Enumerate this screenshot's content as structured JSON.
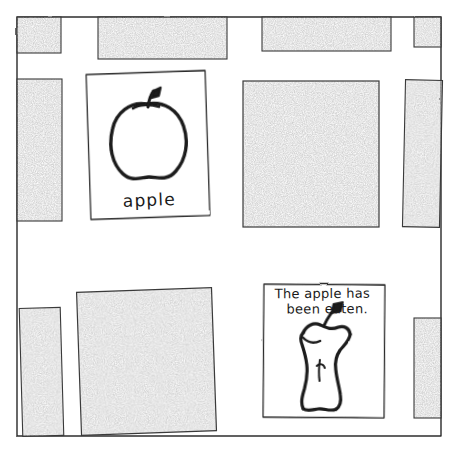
{
  "scene": {
    "title": "apple-and-eaten-apple-sketch",
    "background_color": "#ffffff",
    "ink_color": "#1a1a1a",
    "fill_color": "#c9c9c9",
    "width": 459,
    "height": 454
  },
  "frame": {
    "name": "board-frame",
    "left": 17,
    "top": 17,
    "right": 441,
    "bottom": 436,
    "stroke_color": "#2b2b2b"
  },
  "blocks": [
    {
      "name": "grey-block-top-left",
      "x": 17,
      "y": 17,
      "w": 44,
      "h": 36,
      "rotate": 0.0
    },
    {
      "name": "grey-block-top-second",
      "x": 98,
      "y": 17,
      "w": 129,
      "h": 42,
      "rotate": 0.0
    },
    {
      "name": "grey-block-top-third",
      "x": 262,
      "y": 17,
      "w": 129,
      "h": 34,
      "rotate": 0.0
    },
    {
      "name": "grey-block-top-right",
      "x": 414,
      "y": 17,
      "w": 27,
      "h": 30,
      "rotate": 0.0
    },
    {
      "name": "grey-block-left-tall",
      "x": 17,
      "y": 79,
      "w": 45,
      "h": 142,
      "rotate": 0.0
    },
    {
      "name": "grey-block-center-large",
      "x": 243,
      "y": 81,
      "w": 136,
      "h": 146,
      "rotate": 0.0
    },
    {
      "name": "grey-block-right-tall",
      "x": 404,
      "y": 80,
      "w": 37,
      "h": 147,
      "rotate": 1.2
    },
    {
      "name": "grey-block-bottom-left",
      "x": 21,
      "y": 308,
      "w": 41,
      "h": 128,
      "rotate": -1.6
    },
    {
      "name": "grey-block-bottom-wide",
      "x": 79,
      "y": 290,
      "w": 135,
      "h": 143,
      "rotate": -2.0
    },
    {
      "name": "grey-block-bottom-right",
      "x": 414,
      "y": 318,
      "w": 27,
      "h": 100,
      "rotate": 0.0
    }
  ],
  "cards": [
    {
      "name": "card-whole-apple",
      "x": 88,
      "y": 72,
      "w": 120,
      "h": 146,
      "rotate": -1.5,
      "caption": "apple",
      "drawing": "whole-apple-drawing"
    },
    {
      "name": "card-eaten-apple",
      "x": 263,
      "y": 284,
      "w": 122,
      "h": 134,
      "rotate": 0.8,
      "caption_line_1": "The apple has",
      "caption_line_2": "been    eaten.",
      "drawing": "apple-core-drawing"
    }
  ]
}
